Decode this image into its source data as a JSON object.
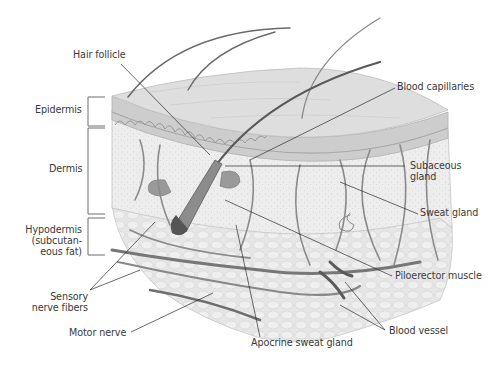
{
  "figure": {
    "colors": {
      "background": "#ffffff",
      "label_text": "#3a3a3a",
      "leader_line": "#2a2a2a",
      "bracket": "#6e6e6e",
      "epidermis_top": "#dcdcdc",
      "epidermis_side": "#c9c9c9",
      "dermis": "#ececec",
      "hypodermis_fat": "#e2e2e2",
      "vessel": "#7a7a7a",
      "vessel_dark": "#555555",
      "gland": "#8a8a8a",
      "hair": "#6a6a6a"
    }
  },
  "layers": [
    {
      "id": "epidermis",
      "label": "Epidermis"
    },
    {
      "id": "dermis",
      "label": "Dermis"
    },
    {
      "id": "hypodermis",
      "label_lines": [
        "Hypodermis",
        "(subcutan-",
        "eous fat)"
      ]
    }
  ],
  "labels": {
    "hair_follicle": "Hair follicle",
    "blood_capillaries": "Blood capillaries",
    "subaceous_gland": [
      "Subaceous",
      "gland"
    ],
    "sweat_gland": "Sweat gland",
    "piloerector_muscle": "Piloerector muscle",
    "blood_vessel": "Blood vessel",
    "apocrine_sweat_gland": "Apocrine sweat gland",
    "motor_nerve": "Motor nerve",
    "sensory_nerve_fibers": [
      "Sensory",
      "nerve fibers"
    ]
  }
}
